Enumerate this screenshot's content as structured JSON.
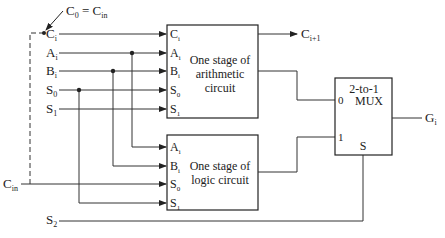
{
  "diagram": {
    "annotation": {
      "main": "C",
      "sub": "0",
      "eq": " = C",
      "eq_sub": "in"
    },
    "inputs": {
      "ci": {
        "main": "C",
        "sub": "i"
      },
      "ai": {
        "main": "A",
        "sub": "i"
      },
      "bi": {
        "main": "B",
        "sub": "i"
      },
      "s0": {
        "main": "S",
        "sub": "0"
      },
      "s1": {
        "main": "S",
        "sub": "1"
      },
      "cin": {
        "main": "C",
        "sub": "in"
      },
      "s2": {
        "main": "S",
        "sub": "2"
      }
    },
    "arith_block": {
      "line1": "One stage of",
      "line2": "arithmetic",
      "line3": "circuit",
      "ports": [
        {
          "main": "C",
          "sub": "i"
        },
        {
          "main": "A",
          "sub": "i"
        },
        {
          "main": "B",
          "sub": "i"
        },
        {
          "main": "S",
          "sub": "0"
        },
        {
          "main": "S",
          "sub": "1"
        }
      ],
      "output": {
        "main": "C",
        "sub": "i+1"
      }
    },
    "logic_block": {
      "line1": "One stage of",
      "line2": "logic circuit",
      "ports": [
        {
          "main": "A",
          "sub": "i"
        },
        {
          "main": "B",
          "sub": "i"
        },
        {
          "main": "S",
          "sub": "0"
        },
        {
          "main": "S",
          "sub": "1"
        }
      ]
    },
    "mux": {
      "line1": "2-to-1",
      "line2": "MUX",
      "in0": "0",
      "in1": "1",
      "sel": "S"
    },
    "output": {
      "main": "G",
      "sub": "i"
    }
  }
}
